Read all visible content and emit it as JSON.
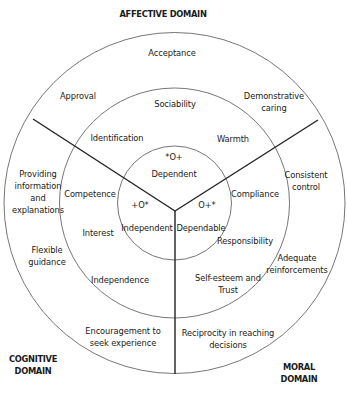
{
  "domains": {
    "affective": "AFFECTIVE DOMAIN",
    "cognitive_line1": "COGNITIVE",
    "cognitive_line2": "DOMAIN",
    "moral_line1": "MORAL",
    "moral_line2": "DOMAIN"
  },
  "outer_ring": {
    "acceptance": "Acceptance",
    "approval": "Approval",
    "demonstrative_caring_1": "Demonstrative",
    "demonstrative_caring_2": "caring",
    "providing_info_1": "Providing",
    "providing_info_2": "information",
    "providing_info_3": "and",
    "providing_info_4": "explanations",
    "flexible_guidance_1": "Flexible",
    "flexible_guidance_2": "guidance",
    "encouragement_1": "Encouragement to",
    "encouragement_2": "seek experience",
    "consistent_control_1": "Consistent",
    "consistent_control_2": "control",
    "adequate_reinforcements_1": "Adequate",
    "adequate_reinforcements_2": "reinforcements",
    "reciprocity_1": "Reciprocity in reaching",
    "reciprocity_2": "decisions"
  },
  "middle_ring": {
    "sociability": "Sociability",
    "identification": "Identification",
    "warmth": "Warmth",
    "competence": "Competence",
    "interest": "Interest",
    "independence": "Independence",
    "compliance": "Compliance",
    "responsibility": "Responsibility",
    "self_esteem_1": "Self-esteem and",
    "self_esteem_2": "Trust"
  },
  "inner_circle": {
    "dependent_code": "*O+",
    "dependent": "Dependent",
    "independent_code": "+O*",
    "independent": "Independent",
    "dependable_code": "O+*",
    "dependable": "Dependable"
  },
  "colors": {
    "circle_stroke": "#555555",
    "divider_stroke": "#222222",
    "text": "#1a1a1a"
  }
}
